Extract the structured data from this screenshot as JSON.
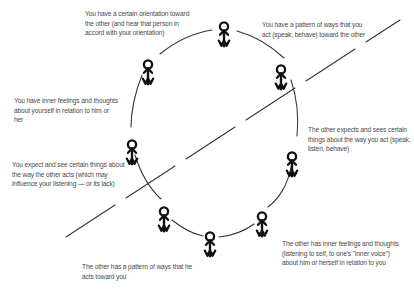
{
  "diagram": {
    "type": "interpersonal-communication-cycle",
    "title": "",
    "figure_count": 8,
    "colors": {
      "ink": "#111111",
      "text": "#4a4a4a",
      "background": "#ffffff"
    },
    "captions": [
      {
        "id": "your-orientation",
        "position": "top-left",
        "text": "You have a certain orientation toward the other (and hear that person in accord with your orientation)"
      },
      {
        "id": "your-pattern-of-ways",
        "position": "top-right",
        "text": "You have a pattern of ways that you act (speak, behave) toward the other"
      },
      {
        "id": "your-inner-feelings",
        "position": "left",
        "text": "You have inner feelings and thoughts about yourself in relation to him or her"
      },
      {
        "id": "other-expects-and-sees",
        "position": "right",
        "text": "The other expects and sees certain things about the way you act (speak, listen, behave)"
      },
      {
        "id": "you-expect-and-see",
        "position": "lower-left",
        "text": "You expect and see certain things about the way the other acts (which may influence your listening — or its lack)"
      },
      {
        "id": "other-pattern-of-ways",
        "position": "bottom",
        "text": "The other has a pattern of ways that he acts toward you"
      },
      {
        "id": "other-inner-feelings",
        "position": "lower-right",
        "text": "The other has inner feelings and thoughts (listening to self, to one's \"inner voice\") about him or herself in relation to you"
      }
    ],
    "figures": [
      {
        "id": "figure-top",
        "label": "stick-figure",
        "x": 224,
        "y": 22
      },
      {
        "id": "figure-upper-left",
        "label": "stick-figure",
        "x": 148,
        "y": 60
      },
      {
        "id": "figure-upper-right",
        "label": "stick-figure",
        "x": 281,
        "y": 65
      },
      {
        "id": "figure-left",
        "label": "stick-figure",
        "x": 132,
        "y": 140
      },
      {
        "id": "figure-right",
        "label": "stick-figure",
        "x": 292,
        "y": 152
      },
      {
        "id": "figure-lower-left",
        "label": "stick-figure",
        "x": 164,
        "y": 207
      },
      {
        "id": "figure-lower-right",
        "label": "stick-figure",
        "x": 262,
        "y": 212
      },
      {
        "id": "figure-bottom",
        "label": "stick-figure",
        "x": 210,
        "y": 232
      }
    ]
  }
}
